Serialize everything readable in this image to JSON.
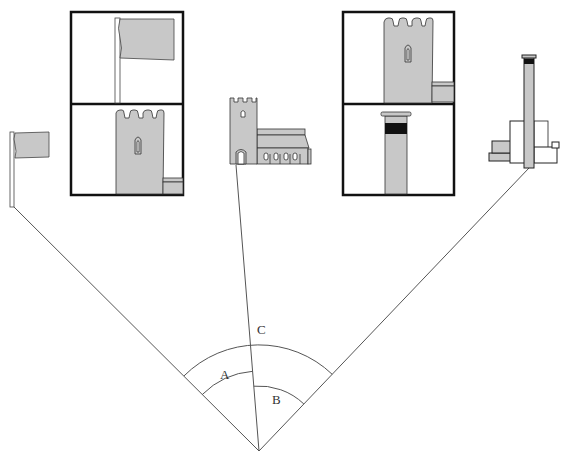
{
  "diagram": {
    "colors": {
      "fill_gray": "#c8c8c8",
      "outline": "#222222",
      "line": "#555555",
      "frame": "#111111",
      "band": "#111111"
    },
    "vertex": {
      "x": 259,
      "y": 451
    },
    "landmarks": [
      {
        "id": "flag",
        "name": "Flagpole",
        "sight_point": {
          "x": 13,
          "y": 206
        }
      },
      {
        "id": "church",
        "name": "Church tower",
        "sight_point": {
          "x": 236,
          "y": 165
        }
      },
      {
        "id": "chimney",
        "name": "Factory chimney",
        "sight_point": {
          "x": 529,
          "y": 168
        }
      }
    ],
    "angles": [
      {
        "label": "A",
        "between": [
          "flag",
          "church"
        ],
        "radius": 80,
        "label_pos": {
          "x": 225,
          "y": 378
        }
      },
      {
        "label": "B",
        "between": [
          "church",
          "chimney"
        ],
        "radius": 65,
        "label_pos": {
          "x": 277,
          "y": 403
        }
      },
      {
        "label": "C",
        "between": [
          "flag",
          "chimney"
        ],
        "radius": 106,
        "label_pos": {
          "x": 262,
          "y": 333
        }
      }
    ],
    "insets": [
      {
        "id": "inset-left",
        "panels": [
          "Flag (enlarged)",
          "Church tower (enlarged)"
        ]
      },
      {
        "id": "inset-right",
        "panels": [
          "Church tower (enlarged)",
          "Chimney top (enlarged)"
        ]
      }
    ]
  }
}
